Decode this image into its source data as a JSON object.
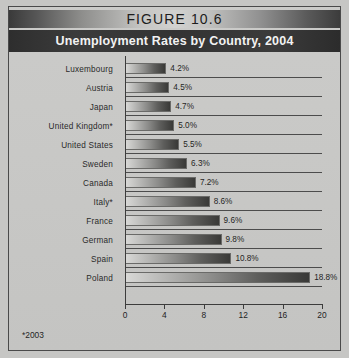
{
  "figure": {
    "band_label": "FIGURE 10.6",
    "title": "Unemployment Rates by Country, 2004",
    "footnote": "*2003"
  },
  "chart_data": {
    "type": "bar",
    "orientation": "horizontal",
    "title": "Unemployment Rates by Country, 2004",
    "xlabel": "",
    "ylabel": "",
    "xlim": [
      0,
      20
    ],
    "xticks": [
      0,
      4,
      8,
      12,
      16,
      20
    ],
    "grid": true,
    "legend": null,
    "categories": [
      "Luxembourg",
      "Austria",
      "Japan",
      "United Kingdom*",
      "United States",
      "Sweden",
      "Canada",
      "Italy*",
      "France",
      "German",
      "Spain",
      "Poland"
    ],
    "values": [
      4.2,
      4.5,
      4.7,
      5.0,
      5.5,
      6.3,
      7.2,
      8.6,
      9.6,
      9.8,
      10.8,
      18.8
    ],
    "value_labels": [
      "4.2%",
      "4.5%",
      "4.7%",
      "5.0%",
      "5.5%",
      "6.3%",
      "7.2%",
      "8.6%",
      "9.6%",
      "9.8%",
      "10.8%",
      "18.8%"
    ],
    "annotations": [
      "*2003"
    ]
  },
  "colors": {
    "page_background": "#c6c6c4",
    "title_band": "#333333",
    "title_text": "#f2f2f2",
    "figure_band_text": "#1d1d1d",
    "bar_light": "#d8d8d6",
    "bar_dark": "#393937",
    "axis": "#3c3c3c",
    "text": "#242424"
  }
}
